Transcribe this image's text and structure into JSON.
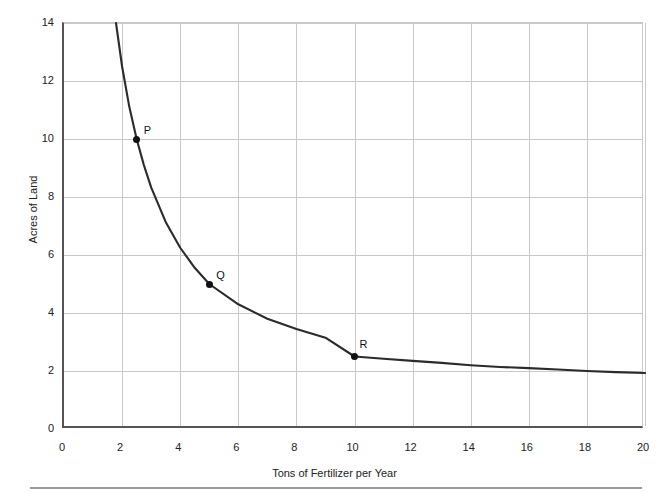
{
  "page": {
    "top_clipped_text": "",
    "footer_rule": "horizontal-rule"
  },
  "chart_data": {
    "type": "line",
    "title": "",
    "xlabel": "Tons of Fertilizer per Year",
    "ylabel": "Acres of Land",
    "xlim": [
      0,
      20
    ],
    "ylim": [
      0,
      14
    ],
    "xticks": [
      0,
      2,
      4,
      6,
      8,
      10,
      12,
      14,
      16,
      18,
      20
    ],
    "yticks": [
      0,
      2,
      4,
      6,
      8,
      10,
      12,
      14
    ],
    "grid": true,
    "legend": "none",
    "curve_color": "#2b2b2b",
    "grid_color": "#c9c9c9",
    "axis_color": "#555555",
    "marker_color": "#111111",
    "series": [
      {
        "name": "isoquant",
        "relation": "x * y = 25",
        "x": [
          1.79,
          2.0,
          2.25,
          2.5,
          2.75,
          3.0,
          3.5,
          4.0,
          4.5,
          5.0,
          6.0,
          7.0,
          8.0,
          9.0,
          10.0,
          11.0,
          12.0,
          13.0,
          14.0,
          15.0,
          16.0,
          17.0,
          18.0,
          19.0,
          20.0
        ],
        "y": [
          14.0,
          12.5,
          11.1,
          10.0,
          9.1,
          8.33,
          7.14,
          6.25,
          5.56,
          5.0,
          4.3,
          3.8,
          3.45,
          3.15,
          2.5,
          2.42,
          2.35,
          2.28,
          2.2,
          2.14,
          2.1,
          2.05,
          2.0,
          1.96,
          1.93
        ]
      }
    ],
    "annotations": [
      {
        "label": "P",
        "x": 2.5,
        "y": 10.0
      },
      {
        "label": "Q",
        "x": 5.0,
        "y": 5.0
      },
      {
        "label": "R",
        "x": 10.0,
        "y": 2.5
      }
    ]
  }
}
